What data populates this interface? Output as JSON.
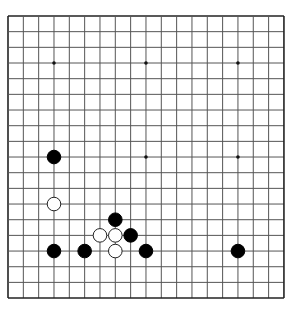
{
  "board": {
    "size": 19,
    "origin_x": 8,
    "origin_y": 16,
    "spacing_x": 15.33,
    "spacing_y": 15.67,
    "line_color": "#555555",
    "border_color": "#222222",
    "background": "#ffffff"
  },
  "star_points": [
    [
      3,
      3
    ],
    [
      9,
      3
    ],
    [
      15,
      3
    ],
    [
      3,
      9
    ],
    [
      9,
      9
    ],
    [
      15,
      9
    ],
    [
      3,
      15
    ],
    [
      9,
      15
    ],
    [
      15,
      15
    ]
  ],
  "stones": [
    {
      "color": "black",
      "col": 3,
      "row": 9
    },
    {
      "color": "white",
      "col": 3,
      "row": 12
    },
    {
      "color": "black",
      "col": 7,
      "row": 13
    },
    {
      "color": "white",
      "col": 6,
      "row": 14
    },
    {
      "color": "white",
      "col": 7,
      "row": 14
    },
    {
      "color": "black",
      "col": 8,
      "row": 14
    },
    {
      "color": "black",
      "col": 3,
      "row": 15
    },
    {
      "color": "black",
      "col": 5,
      "row": 15
    },
    {
      "color": "white",
      "col": 7,
      "row": 15
    },
    {
      "color": "black",
      "col": 9,
      "row": 15
    },
    {
      "color": "black",
      "col": 15,
      "row": 15
    }
  ]
}
